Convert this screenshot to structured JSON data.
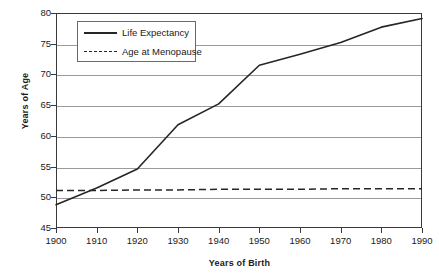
{
  "chart_data": {
    "type": "line",
    "title": "",
    "xlabel": "Years of Birth",
    "ylabel": "Years of Age",
    "x": [
      1900,
      1910,
      1920,
      1930,
      1940,
      1950,
      1960,
      1970,
      1980,
      1990
    ],
    "xlim": [
      1900,
      1990
    ],
    "ylim": [
      45,
      80
    ],
    "xticks": [
      "1900",
      "1910",
      "1920",
      "1930",
      "1940",
      "1950",
      "1960",
      "1970",
      "1980",
      "1990"
    ],
    "yticks": [
      "45",
      "50",
      "55",
      "60",
      "65",
      "70",
      "75",
      "80"
    ],
    "grid": "horizontal",
    "legend_position": "upper-left-inside",
    "series": [
      {
        "name": "Life Expectancy",
        "style": "solid",
        "color": "#262626",
        "values": [
          48.8,
          51.5,
          54.6,
          61.8,
          65.2,
          71.5,
          73.3,
          75.2,
          77.7,
          79.1
        ]
      },
      {
        "name": "Age at Menopause",
        "style": "dashed",
        "color": "#262626",
        "values": [
          51.1,
          51.1,
          51.2,
          51.2,
          51.3,
          51.3,
          51.3,
          51.4,
          51.4,
          51.4
        ]
      }
    ]
  },
  "legend": {
    "items": [
      {
        "label": "Life Expectancy",
        "style": "solid"
      },
      {
        "label": "Age at Menopause",
        "style": "dashed"
      }
    ]
  },
  "colors": {
    "axis": "#3a3a3a",
    "gridline": "#9a9a9a",
    "series": "#262626",
    "background": "#ffffff"
  }
}
